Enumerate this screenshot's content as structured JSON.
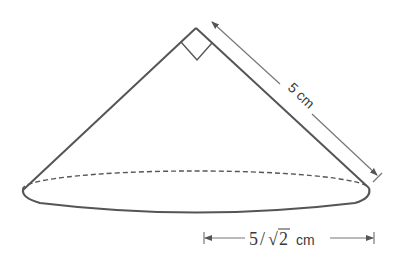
{
  "figure": {
    "type": "right circular cone",
    "apex_angle_marker": "right-angle",
    "slant_height_label": "5 cm",
    "radius_label_number": "5",
    "radius_label_slash": "/",
    "radius_label_sqrt": "√",
    "radius_label_radicand": "2",
    "radius_label_unit": "cm"
  },
  "colors": {
    "stroke": "#555555",
    "text": "#3a3a3a",
    "background": "#ffffff"
  }
}
